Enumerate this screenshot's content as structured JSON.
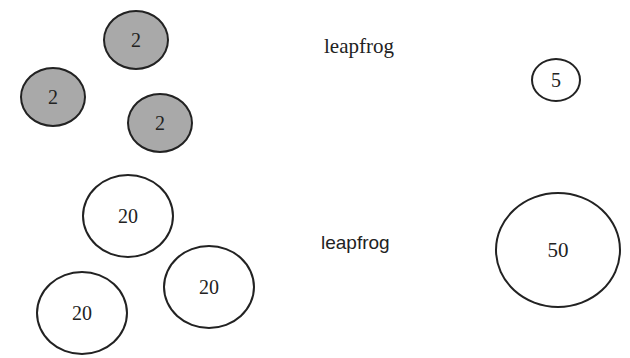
{
  "colors": {
    "small_fill": "#a9a9a9",
    "large_fill": "#ffffff",
    "stroke": "#222222"
  },
  "top_row": {
    "left_circles": [
      {
        "value": "2",
        "cx": 136,
        "cy": 40,
        "rx": 33,
        "ry": 30
      },
      {
        "value": "2",
        "cx": 53,
        "cy": 97,
        "rx": 33,
        "ry": 30
      },
      {
        "value": "2",
        "cx": 160,
        "cy": 123,
        "rx": 33,
        "ry": 30
      }
    ],
    "label": "leapfrog",
    "result_circle": {
      "value": "5",
      "cx": 556,
      "cy": 80,
      "rx": 25,
      "ry": 22
    }
  },
  "bottom_row": {
    "left_circles": [
      {
        "value": "20",
        "cx": 128,
        "cy": 216,
        "rx": 46,
        "ry": 42
      },
      {
        "value": "20",
        "cx": 209,
        "cy": 287,
        "rx": 46,
        "ry": 42
      },
      {
        "value": "20",
        "cx": 82,
        "cy": 313,
        "rx": 46,
        "ry": 42
      }
    ],
    "label": "leapfrog",
    "result_circle": {
      "value": "50",
      "cx": 558,
      "cy": 250,
      "rx": 63,
      "ry": 58
    }
  }
}
